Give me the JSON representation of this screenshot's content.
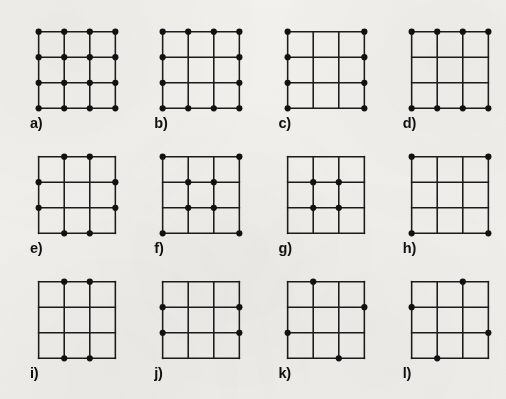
{
  "figure": {
    "kind": "dot-lattice-panel-figure",
    "background_color": "#f2f1ee",
    "line_color": "#1b1b1b",
    "dot_color": "#121212",
    "label_color": "#101010",
    "grid": {
      "nodes_per_side": 4,
      "cells_per_side": 3,
      "node_indices": [
        0,
        1,
        2,
        3
      ]
    },
    "rows": [
      {
        "row_index": 0,
        "panels": [
          {
            "label": "a)",
            "letter": "a",
            "dot_count": 16,
            "pattern_name": "all-nodes",
            "dots": [
              [
                0,
                0
              ],
              [
                1,
                0
              ],
              [
                2,
                0
              ],
              [
                3,
                0
              ],
              [
                0,
                1
              ],
              [
                1,
                1
              ],
              [
                2,
                1
              ],
              [
                3,
                1
              ],
              [
                0,
                2
              ],
              [
                1,
                2
              ],
              [
                2,
                2
              ],
              [
                3,
                2
              ],
              [
                0,
                3
              ],
              [
                1,
                3
              ],
              [
                2,
                3
              ],
              [
                3,
                3
              ]
            ]
          },
          {
            "label": "b)",
            "letter": "b",
            "dot_count": 12,
            "pattern_name": "boundary-nodes-only",
            "dots": [
              [
                0,
                0
              ],
              [
                1,
                0
              ],
              [
                2,
                0
              ],
              [
                3,
                0
              ],
              [
                0,
                1
              ],
              [
                3,
                1
              ],
              [
                0,
                2
              ],
              [
                3,
                2
              ],
              [
                0,
                3
              ],
              [
                1,
                3
              ],
              [
                2,
                3
              ],
              [
                3,
                3
              ]
            ]
          },
          {
            "label": "c)",
            "letter": "c",
            "dot_count": 8,
            "pattern_name": "left-and-right-columns",
            "dots": [
              [
                0,
                0
              ],
              [
                3,
                0
              ],
              [
                0,
                1
              ],
              [
                3,
                1
              ],
              [
                0,
                2
              ],
              [
                3,
                2
              ],
              [
                0,
                3
              ],
              [
                3,
                3
              ]
            ]
          },
          {
            "label": "d)",
            "letter": "d",
            "dot_count": 8,
            "pattern_name": "top-and-bottom-rows",
            "dots": [
              [
                0,
                0
              ],
              [
                1,
                0
              ],
              [
                2,
                0
              ],
              [
                3,
                0
              ],
              [
                0,
                3
              ],
              [
                1,
                3
              ],
              [
                2,
                3
              ],
              [
                3,
                3
              ]
            ]
          }
        ]
      },
      {
        "row_index": 1,
        "panels": [
          {
            "label": "e)",
            "letter": "e",
            "dot_count": 8,
            "pattern_name": "edge-midpoints-no-corners",
            "dots": [
              [
                1,
                0
              ],
              [
                2,
                0
              ],
              [
                0,
                1
              ],
              [
                3,
                1
              ],
              [
                0,
                2
              ],
              [
                3,
                2
              ],
              [
                1,
                3
              ],
              [
                2,
                3
              ]
            ]
          },
          {
            "label": "f)",
            "letter": "f",
            "dot_count": 8,
            "pattern_name": "corners-plus-interior",
            "dots": [
              [
                0,
                0
              ],
              [
                3,
                0
              ],
              [
                1,
                1
              ],
              [
                2,
                1
              ],
              [
                1,
                2
              ],
              [
                2,
                2
              ],
              [
                0,
                3
              ],
              [
                3,
                3
              ]
            ]
          },
          {
            "label": "g)",
            "letter": "g",
            "dot_count": 4,
            "pattern_name": "interior-nodes-only",
            "dots": [
              [
                1,
                1
              ],
              [
                2,
                1
              ],
              [
                1,
                2
              ],
              [
                2,
                2
              ]
            ]
          },
          {
            "label": "h)",
            "letter": "h",
            "dot_count": 4,
            "pattern_name": "corners-only",
            "dots": [
              [
                0,
                0
              ],
              [
                3,
                0
              ],
              [
                0,
                3
              ],
              [
                3,
                3
              ]
            ]
          }
        ]
      },
      {
        "row_index": 2,
        "panels": [
          {
            "label": "i)",
            "letter": "i",
            "dot_count": 4,
            "pattern_name": "top-and-bottom-edge-midpoints",
            "dots": [
              [
                1,
                0
              ],
              [
                2,
                0
              ],
              [
                1,
                3
              ],
              [
                2,
                3
              ]
            ]
          },
          {
            "label": "j)",
            "letter": "j",
            "dot_count": 4,
            "pattern_name": "left-and-right-edge-midpoints",
            "dots": [
              [
                0,
                1
              ],
              [
                3,
                1
              ],
              [
                0,
                2
              ],
              [
                3,
                2
              ]
            ]
          },
          {
            "label": "k)",
            "letter": "k",
            "dot_count": 4,
            "pattern_name": "rotational-pinwheel-clockwise",
            "dots": [
              [
                1,
                0
              ],
              [
                3,
                1
              ],
              [
                0,
                2
              ],
              [
                2,
                3
              ]
            ]
          },
          {
            "label": "l)",
            "letter": "l",
            "dot_count": 4,
            "pattern_name": "rotational-pinwheel-counterclockwise",
            "dots": [
              [
                2,
                0
              ],
              [
                0,
                1
              ],
              [
                3,
                2
              ],
              [
                1,
                3
              ]
            ]
          }
        ]
      }
    ]
  }
}
